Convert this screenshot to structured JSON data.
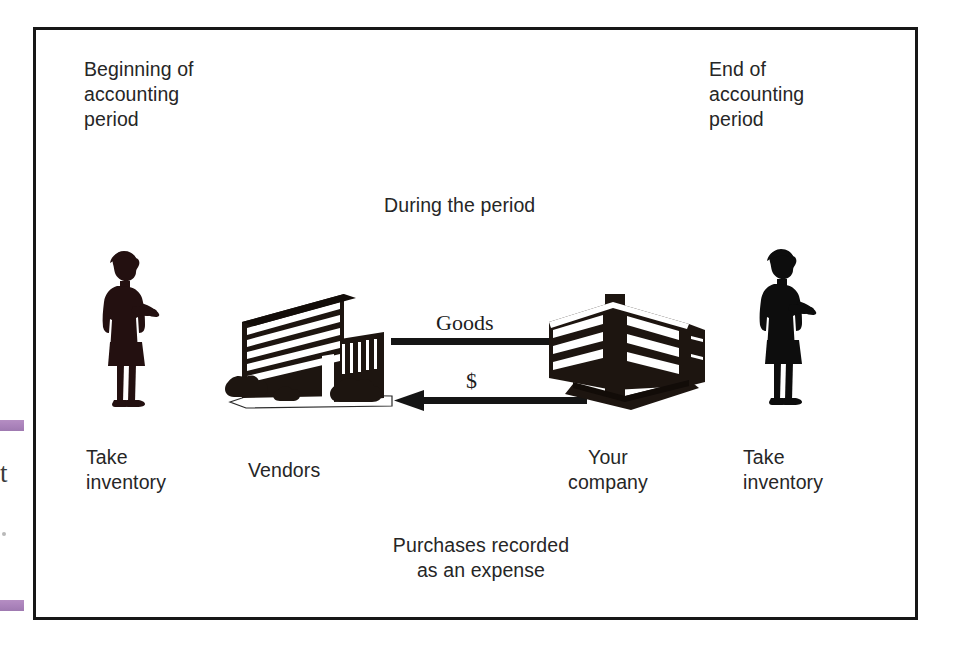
{
  "figure": {
    "kind": "accounting-cycle-diagram",
    "frame_color": "#171717",
    "background_color": "#ffffff",
    "ink_color": "#1a1a1a"
  },
  "corner_labels": {
    "start": "Beginning of\naccounting\nperiod",
    "end": "End of\naccounting\nperiod"
  },
  "period_banner": "During the period",
  "footer_note": "Purchases recorded\nas an expense",
  "nodes": [
    {
      "id": "person-left",
      "icon": "person-with-clipboard-icon",
      "label": "Take\ninventory"
    },
    {
      "id": "vendors",
      "icon": "office-building-icon",
      "label": "Vendors"
    },
    {
      "id": "your-company",
      "icon": "corporate-building-icon",
      "label": "Your\ncompany"
    },
    {
      "id": "person-right",
      "icon": "person-with-clipboard-icon",
      "label": "Take\ninventory"
    }
  ],
  "flows": [
    {
      "id": "goods-flow",
      "label": "Goods",
      "direction": "vendors-to-company",
      "arrow": "right-arrow-icon"
    },
    {
      "id": "payment-flow",
      "label": "$",
      "direction": "company-to-vendors",
      "arrow": "left-arrow-icon"
    }
  ],
  "scan_artifacts": {
    "highlighter_color": "#9b6cae",
    "partial_glyph": "t"
  }
}
